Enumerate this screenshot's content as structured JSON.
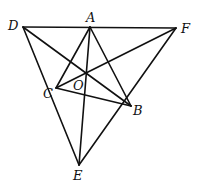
{
  "diagram": {
    "type": "geometry-figure",
    "points": {
      "A": {
        "x": 90,
        "y": 27
      },
      "B": {
        "x": 131,
        "y": 106
      },
      "C": {
        "x": 56,
        "y": 88
      },
      "D": {
        "x": 23,
        "y": 27
      },
      "E": {
        "x": 79,
        "y": 165
      },
      "F": {
        "x": 176,
        "y": 28
      },
      "O": {
        "x": 86,
        "y": 73
      }
    },
    "labels": {
      "A": "A",
      "B": "B",
      "C": "C",
      "D": "D",
      "E": "E",
      "F": "F",
      "O": "O"
    },
    "segments": [
      [
        "D",
        "F"
      ],
      [
        "D",
        "E"
      ],
      [
        "F",
        "E"
      ],
      [
        "D",
        "B"
      ],
      [
        "A",
        "C"
      ],
      [
        "A",
        "E"
      ],
      [
        "A",
        "B"
      ],
      [
        "F",
        "C"
      ],
      [
        "C",
        "B"
      ]
    ]
  }
}
